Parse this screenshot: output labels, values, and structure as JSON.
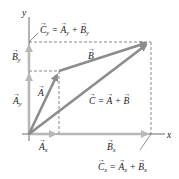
{
  "diagram": {
    "colors": {
      "vector_dark": "#8c8c8c",
      "vector_light": "#b8b8b8",
      "axis": "#444444",
      "dashed": "#555555",
      "text": "#222222"
    },
    "axes": {
      "x_label": "x",
      "y_label": "y"
    },
    "points": {
      "origin": [
        29,
        134
      ],
      "a_tip": [
        59,
        71
      ],
      "c_tip": [
        150,
        42
      ]
    },
    "vectors": [
      {
        "name": "A",
        "label": "A",
        "from": "origin",
        "to": "a_tip"
      },
      {
        "name": "B",
        "label": "B",
        "from": "a_tip",
        "to": "c_tip"
      },
      {
        "name": "C",
        "label": "C",
        "from": "origin",
        "to": "c_tip"
      }
    ],
    "labels": {
      "A": "A",
      "B": "B",
      "C_eq": {
        "lhs": "C",
        "eq": " = ",
        "a": "A",
        "plus": " + ",
        "b": "B"
      },
      "Ax": {
        "base": "A",
        "sub": "x"
      },
      "Ay": {
        "base": "A",
        "sub": "y"
      },
      "Bx": {
        "base": "B",
        "sub": "x"
      },
      "By": {
        "base": "B",
        "sub": "y"
      },
      "Cy_eq": {
        "lhs": "C",
        "lhs_sub": "y",
        "eq": " = ",
        "a": "A",
        "a_sub": "y",
        "plus": " + ",
        "b": "B",
        "b_sub": "y"
      },
      "Cx_eq": {
        "lhs": "C",
        "lhs_sub": "x",
        "eq": " = ",
        "a": "A",
        "a_sub": "x",
        "plus": " + ",
        "b": "B",
        "b_sub": "x"
      }
    }
  }
}
